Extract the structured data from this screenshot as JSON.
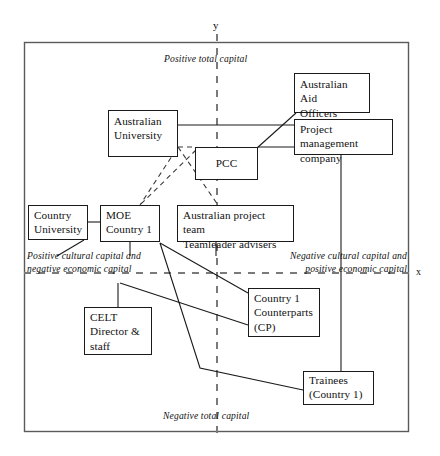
{
  "figure": {
    "type": "diagram",
    "axes": {
      "y_label": "y",
      "x_label": "x",
      "y_axis_x_px": 217,
      "x_axis_y_px": 273
    },
    "quadrant_labels": [
      {
        "id": "top",
        "text": "Positive total capital"
      },
      {
        "id": "bottom",
        "text": "Negative total capital"
      },
      {
        "id": "left",
        "line1": "Positive cultural capital and",
        "line2": "negative economic capital"
      },
      {
        "id": "right",
        "line1": "Negative cultural capital and",
        "line2": "positive economic capital"
      }
    ],
    "nodes": [
      {
        "id": "australian-university",
        "line1": "Australian",
        "line2": "University"
      },
      {
        "id": "pcc",
        "line1": "PCC"
      },
      {
        "id": "australian-aid-officers",
        "line1": "Australian Aid",
        "line2": "Officers"
      },
      {
        "id": "project-management-company",
        "line1": "Project management",
        "line2": "company"
      },
      {
        "id": "country-university",
        "line1": "Country",
        "line2": "University"
      },
      {
        "id": "moe-country",
        "line1": "MOE",
        "line2": "Country 1"
      },
      {
        "id": "australian-project-team",
        "line1": "Australian project team",
        "line2": "Teamleader advisers"
      },
      {
        "id": "country-counterparts",
        "line1": "Country 1",
        "line2": "Counterparts",
        "line3": "(CP)"
      },
      {
        "id": "celt",
        "line1": "CELT",
        "line2": "Director &",
        "line3": "staff"
      },
      {
        "id": "trainees",
        "line1": "Trainees",
        "line2": "(Country 1)"
      }
    ],
    "colors": {
      "line": "#1a1a1a",
      "frame": "#4a4a4a",
      "background": "#ffffff",
      "text": "#111111"
    }
  }
}
